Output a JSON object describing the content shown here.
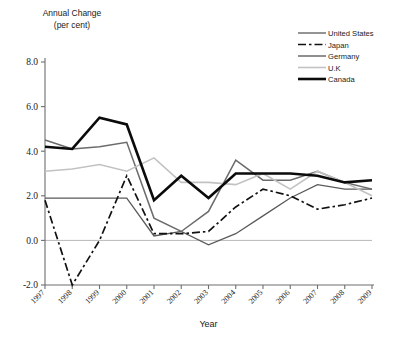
{
  "header": {
    "line1": "Annual Change",
    "line2": "(per cent)"
  },
  "axis": {
    "x_title": "Year",
    "y_ticks": [
      "8.0",
      "6.0",
      "4.0",
      "2.0",
      "0.0",
      "-2.0"
    ]
  },
  "legend": {
    "items": [
      {
        "label": "United States",
        "key": "united_states"
      },
      {
        "label": "Japan",
        "key": "japan"
      },
      {
        "label": "Germany",
        "key": "germany"
      },
      {
        "label": "U.K",
        "key": "uk"
      },
      {
        "label": "Canada",
        "key": "canada"
      }
    ]
  },
  "chart_data": {
    "type": "line",
    "title": "",
    "xlabel": "Year",
    "ylabel": "Annual Change (per cent)",
    "categories": [
      "1997",
      "1998",
      "1999",
      "2000",
      "2001",
      "2002",
      "2003",
      "2004",
      "2005",
      "2006",
      "2007",
      "2008",
      "2009"
    ],
    "x": [
      1997,
      1998,
      1999,
      2000,
      2001,
      2002,
      2003,
      2004,
      2005,
      2006,
      2007,
      2008,
      2009
    ],
    "ylim": [
      -2.0,
      8.0
    ],
    "yticks": [
      -2.0,
      0.0,
      2.0,
      4.0,
      6.0,
      8.0
    ],
    "grid": false,
    "legend_position": "top-right",
    "series": [
      {
        "name": "United States",
        "key": "united_states",
        "color": "#5a5a5a",
        "width": 1.3,
        "dash": "none",
        "values": [
          1.9,
          1.9,
          1.9,
          1.9,
          0.2,
          0.4,
          -0.2,
          0.3,
          1.1,
          1.9,
          2.5,
          2.3,
          2.3
        ]
      },
      {
        "name": "Japan",
        "key": "japan",
        "color": "#111111",
        "width": 1.7,
        "dash": "8,3,2.5,3",
        "values": [
          1.8,
          -2.0,
          0.0,
          2.9,
          0.3,
          0.3,
          0.4,
          1.5,
          2.3,
          2.0,
          1.4,
          1.6,
          1.9
        ]
      },
      {
        "name": "Germany",
        "key": "germany",
        "color": "#6b6b6b",
        "width": 1.5,
        "dash": "none",
        "values": [
          4.5,
          4.1,
          4.2,
          4.4,
          1.0,
          0.4,
          1.3,
          3.6,
          2.7,
          2.7,
          3.1,
          2.6,
          2.3
        ]
      },
      {
        "name": "U.K",
        "key": "uk",
        "color": "#c2c2c2",
        "width": 1.6,
        "dash": "none",
        "values": [
          3.1,
          3.2,
          3.4,
          3.1,
          3.7,
          2.6,
          2.6,
          2.5,
          3.0,
          2.3,
          3.1,
          2.6,
          2.0
        ]
      },
      {
        "name": "Canada",
        "key": "canada",
        "color": "#0b0b0b",
        "width": 2.6,
        "dash": "none",
        "values": [
          4.2,
          4.1,
          5.5,
          5.2,
          1.8,
          2.9,
          1.9,
          3.0,
          3.0,
          3.0,
          2.9,
          2.6,
          2.7
        ]
      }
    ]
  }
}
